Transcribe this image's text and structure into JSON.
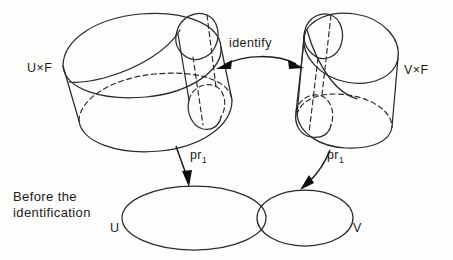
{
  "figure": {
    "caption_line1": "Before the",
    "caption_line2": "identification",
    "stroke_color": "#2a2a2a",
    "background_color": "#fdfdfb"
  },
  "labels": {
    "left_cylinder": "U×F",
    "right_cylinder": "V×F",
    "identify": "identify",
    "projection_left_base": "pr",
    "projection_left_sub": "1",
    "projection_right_base": "pr",
    "projection_right_sub": "1",
    "set_left": "U",
    "set_right": "V"
  },
  "icons": {
    "identify_arrow": "double-headed-arrow-icon",
    "projection_arrow_left": "arrow-down-icon",
    "projection_arrow_right": "arrow-down-icon"
  }
}
